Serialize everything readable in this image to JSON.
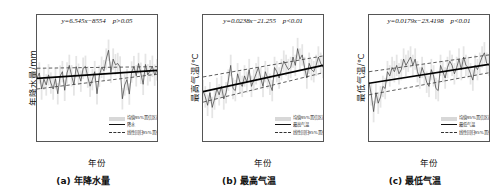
{
  "figure": {
    "panel_count": 3
  },
  "legend": {
    "band_label": "均值95%置信区间",
    "regression_label": "线性回归95%置信区间"
  },
  "panels": [
    {
      "caption": "(a) 年降水量",
      "xlabel": "年份",
      "ylabel": "年降水量/mm",
      "series_label": "降水",
      "equation": "y=6.545x−8554",
      "pvalue": "p>0.05",
      "yticks": [
        "0",
        "200",
        "400",
        "600",
        "800"
      ],
      "xticks": [
        "1970",
        "1980",
        "1990",
        "2000",
        "2010"
      ]
    },
    {
      "caption": "(b) 最高气温",
      "xlabel": "年份",
      "ylabel": "最高气温/℃",
      "series_label": "最高气温",
      "equation": "y=0.0238x−21.255",
      "pvalue": "p<0.01",
      "yticks": [
        "23",
        "24",
        "25",
        "26",
        "27",
        "28",
        "29"
      ],
      "xticks": [
        "1970",
        "1980",
        "1990",
        "2000",
        "2010"
      ]
    },
    {
      "caption": "(c) 最低气温",
      "xlabel": "年份",
      "ylabel": "最低气温/℃",
      "series_label": "最低气温",
      "equation": "y=0.0179x−23.4198",
      "pvalue": "p<0.01",
      "yticks": [
        "9",
        "10",
        "11",
        "12",
        "13",
        "14",
        "15"
      ],
      "xticks": [
        "1970",
        "1980",
        "1990",
        "2000",
        "2010"
      ]
    }
  ],
  "chart_data": [
    {
      "type": "line",
      "title": "(a) 年降水量",
      "xlabel": "年份",
      "ylabel": "年降水量/mm",
      "xlim": [
        1963,
        2015
      ],
      "ylim": [
        0,
        800
      ],
      "yticks": [
        0,
        200,
        400,
        600,
        800
      ],
      "xticks": [
        1970,
        1980,
        1990,
        2000,
        2010
      ],
      "grid": false,
      "legend_position": "lower-right",
      "annotations": [
        "y=6.545x−8554",
        "p>0.05"
      ],
      "trend": {
        "slope": 6.545,
        "intercept": -8554,
        "p": "p>0.05",
        "significant": false
      },
      "series": [
        {
          "name": "降水",
          "x": [
            1963,
            1964,
            1965,
            1966,
            1967,
            1968,
            1969,
            1970,
            1971,
            1972,
            1973,
            1974,
            1975,
            1976,
            1977,
            1978,
            1979,
            1980,
            1981,
            1982,
            1983,
            1984,
            1985,
            1986,
            1987,
            1988,
            1989,
            1990,
            1991,
            1992,
            1993,
            1994,
            1995,
            1996,
            1997,
            1998,
            1999,
            2000,
            2001,
            2002,
            2003,
            2004,
            2005,
            2006,
            2007,
            2008,
            2009,
            2010,
            2011,
            2012,
            2013,
            2014,
            2015
          ],
          "values": [
            398,
            432,
            330,
            392,
            356,
            420,
            368,
            330,
            396,
            300,
            412,
            440,
            322,
            432,
            480,
            414,
            356,
            472,
            424,
            380,
            462,
            474,
            406,
            348,
            390,
            440,
            300,
            412,
            468,
            446,
            520,
            576,
            436,
            520,
            484,
            492,
            470,
            268,
            356,
            390,
            298,
            438,
            472,
            414,
            492,
            430,
            360,
            486,
            420,
            446,
            474,
            418,
            452
          ]
        },
        {
          "name": "线性回归95%置信区间上界",
          "x": [
            1963,
            2015
          ],
          "values": [
            462,
            472
          ]
        },
        {
          "name": "线性回归95%置信区间下界",
          "x": [
            1963,
            2015
          ],
          "values": [
            330,
            424
          ]
        },
        {
          "name": "趋势线",
          "x": [
            1963,
            2015
          ],
          "values": [
            398,
            448
          ]
        }
      ]
    },
    {
      "type": "line",
      "title": "(b) 最高气温",
      "xlabel": "年份",
      "ylabel": "最高气温/℃",
      "xlim": [
        1963,
        2015
      ],
      "ylim": [
        23,
        29
      ],
      "yticks": [
        23,
        24,
        25,
        26,
        27,
        28,
        29
      ],
      "xticks": [
        1970,
        1980,
        1990,
        2000,
        2010
      ],
      "grid": false,
      "legend_position": "lower-right",
      "annotations": [
        "y=0.0238x−21.255",
        "p<0.01"
      ],
      "trend": {
        "slope": 0.0238,
        "intercept": -21.255,
        "p": "p<0.01",
        "significant": true
      },
      "series": [
        {
          "name": "最高气温",
          "x": [
            1963,
            1964,
            1965,
            1966,
            1967,
            1968,
            1969,
            1970,
            1971,
            1972,
            1973,
            1974,
            1975,
            1976,
            1977,
            1978,
            1979,
            1980,
            1981,
            1982,
            1983,
            1984,
            1985,
            1986,
            1987,
            1988,
            1989,
            1990,
            1991,
            1992,
            1993,
            1994,
            1995,
            1996,
            1997,
            1998,
            1999,
            2000,
            2001,
            2002,
            2003,
            2004,
            2005,
            2006,
            2007,
            2008,
            2009,
            2010,
            2011,
            2012,
            2013,
            2014,
            2015
          ],
          "values": [
            25.4,
            25.1,
            24.7,
            25.3,
            24.6,
            25.0,
            25.5,
            25.2,
            25.6,
            25.0,
            25.3,
            25.9,
            26.6,
            25.5,
            25.4,
            26.2,
            25.8,
            25.6,
            26.1,
            25.8,
            26.4,
            25.6,
            25.9,
            26.2,
            26.5,
            26.0,
            25.6,
            26.3,
            26.0,
            25.7,
            25.4,
            26.5,
            26.3,
            26.0,
            26.4,
            26.8,
            26.6,
            26.4,
            26.5,
            27.0,
            26.6,
            27.4,
            26.9,
            27.1,
            26.5,
            26.0,
            26.7,
            26.4,
            26.3,
            26.6,
            27.0,
            26.7,
            26.5
          ]
        },
        {
          "name": "线性回归95%置信区间上界",
          "x": [
            1963,
            2015
          ],
          "values": [
            26.05,
            27.05
          ]
        },
        {
          "name": "线性回归95%置信区间下界",
          "x": [
            1963,
            2015
          ],
          "values": [
            24.85,
            26.25
          ]
        },
        {
          "name": "趋势线",
          "x": [
            1963,
            2015
          ],
          "values": [
            25.35,
            26.6
          ]
        }
      ]
    },
    {
      "type": "line",
      "title": "(c) 最低气温",
      "xlabel": "年份",
      "ylabel": "最低气温/℃",
      "xlim": [
        1963,
        2015
      ],
      "ylim": [
        9,
        15
      ],
      "yticks": [
        9,
        10,
        11,
        12,
        13,
        14,
        15
      ],
      "xticks": [
        1970,
        1980,
        1990,
        2000,
        2010
      ],
      "grid": false,
      "legend_position": "lower-right",
      "annotations": [
        "y=0.0179x−23.4198",
        "p<0.01"
      ],
      "trend": {
        "slope": 0.0179,
        "intercept": -23.4198,
        "p": "p<0.01",
        "significant": true
      },
      "series": [
        {
          "name": "最低气温",
          "x": [
            1963,
            1964,
            1965,
            1966,
            1967,
            1968,
            1969,
            1970,
            1971,
            1972,
            1973,
            1974,
            1975,
            1976,
            1977,
            1978,
            1979,
            1980,
            1981,
            1982,
            1983,
            1984,
            1985,
            1986,
            1987,
            1988,
            1989,
            1990,
            1991,
            1992,
            1993,
            1994,
            1995,
            1996,
            1997,
            1998,
            1999,
            2000,
            2001,
            2002,
            2003,
            2004,
            2005,
            2006,
            2007,
            2008,
            2009,
            2010,
            2011,
            2012,
            2013,
            2014,
            2015
          ],
          "values": [
            11.8,
            11.2,
            10.4,
            11.3,
            10.8,
            11.1,
            11.6,
            11.5,
            12.3,
            12.1,
            12.5,
            12.3,
            12.6,
            12.2,
            12.4,
            12.9,
            12.6,
            12.8,
            13.0,
            12.6,
            12.9,
            12.3,
            12.0,
            12.5,
            12.2,
            11.8,
            11.6,
            12.4,
            12.1,
            11.5,
            11.4,
            12.6,
            12.3,
            12.0,
            12.5,
            12.8,
            12.6,
            12.2,
            12.5,
            12.9,
            12.4,
            13.0,
            12.6,
            12.5,
            12.2,
            11.9,
            12.6,
            12.4,
            12.7,
            13.0,
            13.2,
            12.7,
            12.6
          ]
        },
        {
          "name": "线性回归95%置信区间上界",
          "x": [
            1963,
            2015
          ],
          "values": [
            12.3,
            13.1
          ]
        },
        {
          "name": "线性回归95%置信区间下界",
          "x": [
            1963,
            2015
          ],
          "values": [
            11.2,
            12.25
          ]
        },
        {
          "name": "趋势线",
          "x": [
            1963,
            2015
          ],
          "values": [
            11.75,
            12.65
          ]
        }
      ]
    }
  ]
}
